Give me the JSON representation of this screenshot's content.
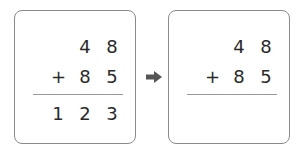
{
  "left_box": {
    "top_row": [
      "4",
      "8"
    ],
    "operator": "+",
    "second_row": [
      "8",
      "5"
    ],
    "result_row": [
      "1",
      "2",
      "3"
    ]
  },
  "right_box": {
    "top_row": [
      "4",
      "8"
    ],
    "operator": "+",
    "second_row": [
      "8",
      "5"
    ],
    "result_row": []
  },
  "arrow": "right-arrow-icon"
}
